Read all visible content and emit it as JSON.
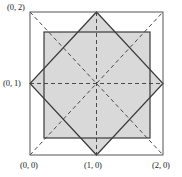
{
  "figure": {
    "labels": {
      "top_left": "(0, 2)",
      "left_mid": "(0, 1)",
      "bottom_left": "(0, 0)",
      "bottom_mid": "(1, 0)",
      "bottom_right": "(2, 0)"
    },
    "colors": {
      "background": "#ffffff",
      "shaded_region": "#d9d9d9",
      "stroke_solid": "#3a3a3a",
      "stroke_outer": "#555555",
      "stroke_dashed": "#4a4a4a",
      "label_text": "#1a1a1a"
    },
    "geometry": {
      "outer_square": {
        "name": "outer-square",
        "x0": 30,
        "y0": 12,
        "x1": 163,
        "y1": 155,
        "coordinate_corners": [
          "(0, 0)",
          "(2, 0)",
          "(2, 2)",
          "(0, 2)"
        ]
      },
      "inner_square": {
        "name": "inner-axis-aligned-square",
        "x0": 44,
        "y0": 32,
        "x1": 150,
        "y1": 138
      },
      "diamond": {
        "name": "rotated-square-diamond",
        "vertices": [
          {
            "x": 96.5,
            "y": 12
          },
          {
            "x": 163,
            "y": 83.5
          },
          {
            "x": 96.5,
            "y": 155
          },
          {
            "x": 30,
            "y": 83.5
          }
        ]
      },
      "center": {
        "x": 96.5,
        "y": 83.5,
        "coordinate": "(1, 1)"
      },
      "dashed_lines": [
        {
          "name": "dashed-horizontal-axis",
          "x1": 30,
          "y1": 83.5,
          "x2": 163,
          "y2": 83.5
        },
        {
          "name": "dashed-vertical-axis",
          "x1": 96.5,
          "y1": 12,
          "x2": 96.5,
          "y2": 155
        },
        {
          "name": "dashed-diagonal-main",
          "x1": 30,
          "y1": 155,
          "x2": 163,
          "y2": 12
        },
        {
          "name": "dashed-diagonal-anti",
          "x1": 30,
          "y1": 12,
          "x2": 163,
          "y2": 155
        }
      ]
    }
  }
}
